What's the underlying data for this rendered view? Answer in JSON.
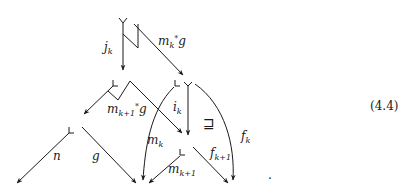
{
  "equation_number": "(4.4)",
  "trailing_period": ".",
  "relation_symbol": "⊒",
  "labels": {
    "jk": {
      "base": "j",
      "sub": "k"
    },
    "mk_star_g": {
      "base": "m",
      "sub": "k",
      "sup": "*",
      "tail": "g"
    },
    "mk1_star_g": {
      "base": "m",
      "sub": "k+1",
      "sup": "*",
      "tail": "g"
    },
    "ik": {
      "base": "i",
      "sub": "k"
    },
    "mk": {
      "base": "m",
      "sub": "k"
    },
    "fk": {
      "base": "f",
      "sub": "k"
    },
    "fk1": {
      "base": "f",
      "sub": "k+1"
    },
    "mk1": {
      "base": "m",
      "sub": "k+1"
    },
    "n": {
      "base": "n"
    },
    "g": {
      "base": "g"
    }
  },
  "colors": {
    "stroke": "#1a1a1a",
    "background": "#ffffff"
  }
}
